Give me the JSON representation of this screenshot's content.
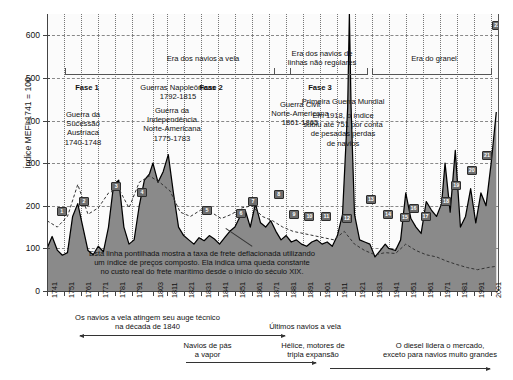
{
  "chart_data": {
    "type": "area",
    "title": "",
    "xlabel": "",
    "ylabel": "Índice MEFI 1741 = 100",
    "ylim": [
      0,
      650
    ],
    "yticks": [
      0,
      100,
      200,
      300,
      400,
      500,
      600
    ],
    "xlim": [
      1741,
      2005
    ],
    "xticks": [
      "1741",
      "1751",
      "1761",
      "1771",
      "1781",
      "1791",
      "1803",
      "1811",
      "1821",
      "1831",
      "1841",
      "1851",
      "1861",
      "1871",
      "1881",
      "1891",
      "1901",
      "1911",
      "1921",
      "1931",
      "1941",
      "1951",
      "1961",
      "1971",
      "1981",
      "1991",
      "2001"
    ],
    "grid": true,
    "legend_position": "none",
    "series": [
      {
        "name": "Taxa de frete nominal (índice MEFI)",
        "style": "filled-area",
        "fill_color": "#8a8a8a",
        "line_color": "#000000",
        "x": [
          1741,
          1744,
          1747,
          1750,
          1753,
          1756,
          1759,
          1762,
          1765,
          1768,
          1771,
          1774,
          1777,
          1780,
          1783,
          1786,
          1789,
          1792,
          1795,
          1798,
          1801,
          1803,
          1806,
          1809,
          1812,
          1815,
          1818,
          1821,
          1824,
          1827,
          1830,
          1833,
          1836,
          1839,
          1842,
          1845,
          1848,
          1851,
          1854,
          1857,
          1860,
          1863,
          1866,
          1869,
          1872,
          1875,
          1878,
          1881,
          1884,
          1887,
          1890,
          1893,
          1896,
          1899,
          1902,
          1905,
          1908,
          1911,
          1914,
          1917,
          1918,
          1919,
          1921,
          1924,
          1927,
          1930,
          1933,
          1936,
          1939,
          1941,
          1945,
          1948,
          1951,
          1954,
          1957,
          1960,
          1963,
          1966,
          1969,
          1972,
          1974,
          1977,
          1980,
          1983,
          1986,
          1989,
          1992,
          1995,
          1998,
          2001,
          2004
        ],
        "y": [
          100,
          128,
          96,
          84,
          90,
          175,
          205,
          150,
          95,
          85,
          105,
          92,
          150,
          250,
          260,
          150,
          110,
          120,
          200,
          260,
          275,
          300,
          255,
          280,
          320,
          230,
          150,
          130,
          120,
          110,
          125,
          118,
          130,
          122,
          110,
          125,
          140,
          150,
          175,
          190,
          150,
          205,
          160,
          150,
          165,
          140,
          120,
          130,
          115,
          120,
          110,
          105,
          115,
          120,
          110,
          115,
          105,
          130,
          180,
          430,
          751,
          430,
          180,
          120,
          115,
          110,
          80,
          95,
          110,
          100,
          95,
          120,
          230,
          170,
          150,
          135,
          210,
          190,
          175,
          205,
          300,
          185,
          330,
          150,
          175,
          240,
          160,
          230,
          200,
          300,
          420
        ]
      },
      {
        "name": "Taxa de frete deflacionada por índice de preços composto",
        "style": "dashed-line",
        "line_color": "#333333",
        "x": [
          1741,
          1747,
          1753,
          1759,
          1765,
          1771,
          1777,
          1783,
          1789,
          1795,
          1801,
          1807,
          1813,
          1819,
          1825,
          1831,
          1837,
          1843,
          1849,
          1855,
          1861,
          1867,
          1873,
          1879,
          1885,
          1891,
          1897,
          1903,
          1909,
          1915,
          1921,
          1927,
          1933,
          1939,
          1945,
          1951,
          1957,
          1963,
          1969,
          1975,
          1981,
          1987,
          1993,
          1999,
          2004
        ],
        "y": [
          165,
          150,
          175,
          250,
          180,
          195,
          230,
          240,
          195,
          255,
          270,
          255,
          235,
          185,
          175,
          190,
          185,
          170,
          180,
          195,
          200,
          175,
          165,
          150,
          140,
          135,
          130,
          125,
          120,
          140,
          110,
          95,
          85,
          90,
          88,
          110,
          95,
          85,
          80,
          70,
          62,
          55,
          50,
          55,
          58
        ]
      }
    ],
    "annotations": [
      {
        "id": "1",
        "x": 1749,
        "y": 190
      },
      {
        "id": "2",
        "x": 1762,
        "y": 213
      },
      {
        "id": "3",
        "x": 1781,
        "y": 248
      },
      {
        "id": "4",
        "x": 1796,
        "y": 233
      },
      {
        "id": "5",
        "x": 1834,
        "y": 192
      },
      {
        "id": "6",
        "x": 1854,
        "y": 185
      },
      {
        "id": "7",
        "x": 1861,
        "y": 212
      },
      {
        "id": "8",
        "x": 1876,
        "y": 228
      },
      {
        "id": "9",
        "x": 1885,
        "y": 182
      },
      {
        "id": "10",
        "x": 1894,
        "y": 178
      },
      {
        "id": "11",
        "x": 1904,
        "y": 178
      },
      {
        "id": "12",
        "x": 1916,
        "y": 172
      },
      {
        "id": "13",
        "x": 1930,
        "y": 218
      },
      {
        "id": "14",
        "x": 1940,
        "y": 182
      },
      {
        "id": "15",
        "x": 1950,
        "y": 175
      },
      {
        "id": "16",
        "x": 1955,
        "y": 196
      },
      {
        "id": "17",
        "x": 1962,
        "y": 178
      },
      {
        "id": "18",
        "x": 1974,
        "y": 212
      },
      {
        "id": "19",
        "x": 1980,
        "y": 250
      },
      {
        "id": "20",
        "x": 1989,
        "y": 286
      },
      {
        "id": "21",
        "x": 1998,
        "y": 320
      },
      {
        "id": "22",
        "x": 2004,
        "y": 625
      }
    ]
  },
  "yaxis": {
    "label": "Índice MEFI 1741 = 100",
    "ticks": [
      "600",
      "500",
      "400",
      "300",
      "200",
      "100",
      "0"
    ]
  },
  "eras": [
    {
      "label": "Era dos navios a vela"
    },
    {
      "label": "Era dos navios de\nlinhas não regulares"
    },
    {
      "label": "Era do granel"
    }
  ],
  "phases": [
    {
      "label": "Fase 1"
    },
    {
      "label": "Fase 2"
    },
    {
      "label": "Fase 3"
    }
  ],
  "events": [
    {
      "label": "Guerra da\nSucessão\nAustríaca\n1740-1748"
    },
    {
      "label": "Guerras Napoleônicas\n1792-1815"
    },
    {
      "label": "Guerra da\nIndependência\nNorte-Americana\n1775-1783"
    },
    {
      "label": "Guerra Civil\nNorte-Americana\n1861-1865"
    },
    {
      "label": "Primeira Guerra Mundial"
    },
    {
      "label": "Em 1918, o índice\nsubiu até 751 por conta\nde pesadas perdas\nde navios"
    }
  ],
  "dashed_note": "Esta linha pontilhada mostra a taxa de frete deflacionada utilizando\num índice de preços composto. Ela indica uma queda constante\nno custo real do frete marítimo desde o início do século XIX.",
  "captions": [
    {
      "label": "Os navios a vela atingem seu auge técnico\nna década de 1840"
    },
    {
      "label": "Últimos navios a vela"
    },
    {
      "label": "Navios de pás\na vapor"
    },
    {
      "label": "Hélice, motores de\ntripla expansão"
    },
    {
      "label": "O diesel lidera o mercado,\nexceto para navios muito grandes"
    }
  ],
  "colors": {
    "area_fill": "#8a8a8a",
    "area_line": "#000000",
    "dashed_line": "#333333",
    "marker_bg": "#6d6d6d",
    "grid": "#888888",
    "axis": "#444444"
  }
}
